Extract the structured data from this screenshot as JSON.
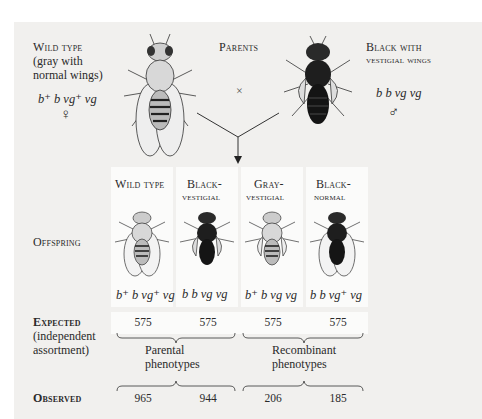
{
  "parents": {
    "title": "Parents",
    "cross_symbol": "×",
    "female": {
      "label_line1": "Wild type",
      "label_line2": "(gray with",
      "label_line3": "normal wings)",
      "genotype": "b⁺ b vg⁺ vg",
      "sex_symbol": "♀"
    },
    "male": {
      "label_line1": "Black with",
      "label_line2": "vestigial wings",
      "genotype": "b b vg vg",
      "sex_symbol": "♂"
    }
  },
  "offspring": {
    "row_label": "Offspring",
    "columns": [
      {
        "label_line1": "Wild type",
        "label_line2": "",
        "genotype": "b⁺ b vg⁺ vg",
        "body": "gray",
        "wings": "normal"
      },
      {
        "label_line1": "Black-",
        "label_line2": "vestigial",
        "genotype": "b b vg vg",
        "body": "black",
        "wings": "vestigial"
      },
      {
        "label_line1": "Gray-",
        "label_line2": "vestigial",
        "genotype": "b⁺ b vg vg",
        "body": "gray",
        "wings": "vestigial"
      },
      {
        "label_line1": "Black-",
        "label_line2": "normal",
        "genotype": "b b vg⁺ vg",
        "body": "black",
        "wings": "normal"
      }
    ]
  },
  "expected": {
    "label_line1": "Expected",
    "label_line2": "(independent",
    "label_line3": "assortment)",
    "values": [
      "575",
      "575",
      "575",
      "575"
    ]
  },
  "groups": {
    "parental_line1": "Parental",
    "parental_line2": "phenotypes",
    "recombinant_line1": "Recombinant",
    "recombinant_line2": "phenotypes"
  },
  "observed": {
    "label": "Observed",
    "values": [
      "965",
      "944",
      "206",
      "185"
    ]
  },
  "colors": {
    "panel_bg": "#f1f0ee",
    "column_bg": "#fbfbfa",
    "text": "#2a2a2a"
  }
}
